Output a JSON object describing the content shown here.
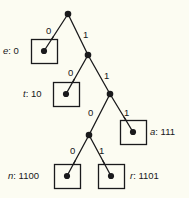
{
  "figure": {
    "type": "binary-huffman-code-tree",
    "background_color": "#fcfcf2",
    "stroke_color": "#1a1a1c",
    "node_fill": "#1a1a1c",
    "leaf_box_fill": "#fcfcf2",
    "width": 189,
    "height": 198
  },
  "nodes": {
    "root": {
      "id": "root",
      "x": 68,
      "y": 14,
      "kind": "internal"
    },
    "n1": {
      "id": "n1",
      "x": 88,
      "y": 55,
      "kind": "internal"
    },
    "n2": {
      "id": "n2",
      "x": 110,
      "y": 94,
      "kind": "internal"
    },
    "n3": {
      "id": "n3",
      "x": 89,
      "y": 135,
      "kind": "internal"
    },
    "leaf_e": {
      "id": "leaf_e",
      "x": 44,
      "y": 51,
      "kind": "leaf"
    },
    "leaf_t": {
      "id": "leaf_t",
      "x": 66,
      "y": 94,
      "kind": "leaf"
    },
    "leaf_a": {
      "id": "leaf_a",
      "x": 133,
      "y": 132,
      "kind": "leaf"
    },
    "leaf_n": {
      "id": "leaf_n",
      "x": 67,
      "y": 176,
      "kind": "leaf"
    },
    "leaf_r": {
      "id": "leaf_r",
      "x": 111,
      "y": 176,
      "kind": "leaf"
    }
  },
  "leaf_boxes": [
    {
      "name": "e",
      "x": 31,
      "y": 39,
      "w": 26,
      "h": 24
    },
    {
      "name": "t",
      "x": 53,
      "y": 82,
      "w": 26,
      "h": 24
    },
    {
      "name": "a",
      "x": 120,
      "y": 120,
      "w": 26,
      "h": 24
    },
    {
      "name": "n",
      "x": 54,
      "y": 164,
      "w": 26,
      "h": 24
    },
    {
      "name": "r",
      "x": 98,
      "y": 164,
      "w": 26,
      "h": 24
    }
  ],
  "edges": [
    {
      "from": "root",
      "to": "leaf_e",
      "bit": "0",
      "label_x": 46,
      "label_y": 26
    },
    {
      "from": "root",
      "to": "n1",
      "bit": "1",
      "label_x": 83,
      "label_y": 30
    },
    {
      "from": "n1",
      "to": "leaf_t",
      "bit": "0",
      "label_x": 68,
      "label_y": 68
    },
    {
      "from": "n1",
      "to": "n2",
      "bit": "1",
      "label_x": 104,
      "label_y": 71
    },
    {
      "from": "n2",
      "to": "n3",
      "bit": "0",
      "label_x": 88,
      "label_y": 108
    },
    {
      "from": "n2",
      "to": "leaf_a",
      "bit": "1",
      "label_x": 124,
      "label_y": 108
    },
    {
      "from": "n3",
      "to": "leaf_n",
      "bit": "0",
      "label_x": 70,
      "label_y": 146
    },
    {
      "from": "n3",
      "to": "leaf_r",
      "bit": "1",
      "label_x": 99,
      "label_y": 146
    }
  ],
  "leaf_labels": [
    {
      "id": "label-e",
      "symbol": "e",
      "separator": ": ",
      "code": "0",
      "text": "e: 0",
      "x": 3,
      "y": 46,
      "align": "left"
    },
    {
      "id": "label-t",
      "symbol": "t",
      "separator": ": ",
      "code": "10",
      "text": "t: 10",
      "x": 23,
      "y": 89,
      "align": "left"
    },
    {
      "id": "label-a",
      "symbol": "a",
      "separator": ": ",
      "code": "111",
      "text": "a: 111",
      "x": 150,
      "y": 127,
      "align": "left"
    },
    {
      "id": "label-n",
      "symbol": "n",
      "separator": ": ",
      "code": "1100",
      "text": "n: 1100",
      "x": 8,
      "y": 171,
      "align": "left"
    },
    {
      "id": "label-r",
      "symbol": "r",
      "separator": ": ",
      "code": "1101",
      "text": "r: 1101",
      "x": 130,
      "y": 171,
      "align": "left"
    }
  ]
}
